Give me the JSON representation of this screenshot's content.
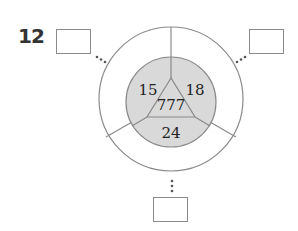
{
  "problem": {
    "number": "12",
    "center_value": "777",
    "sections": {
      "top_left": "15",
      "top_right": "18",
      "bottom": "24"
    },
    "answer_boxes": [
      {
        "position": "top-left",
        "value": ""
      },
      {
        "position": "top-right",
        "value": ""
      },
      {
        "position": "bottom",
        "value": ""
      }
    ],
    "colors": {
      "inner_fill": "#d9d9d9",
      "stroke": "#8a8a8a",
      "outer_fill": "#ffffff"
    }
  }
}
